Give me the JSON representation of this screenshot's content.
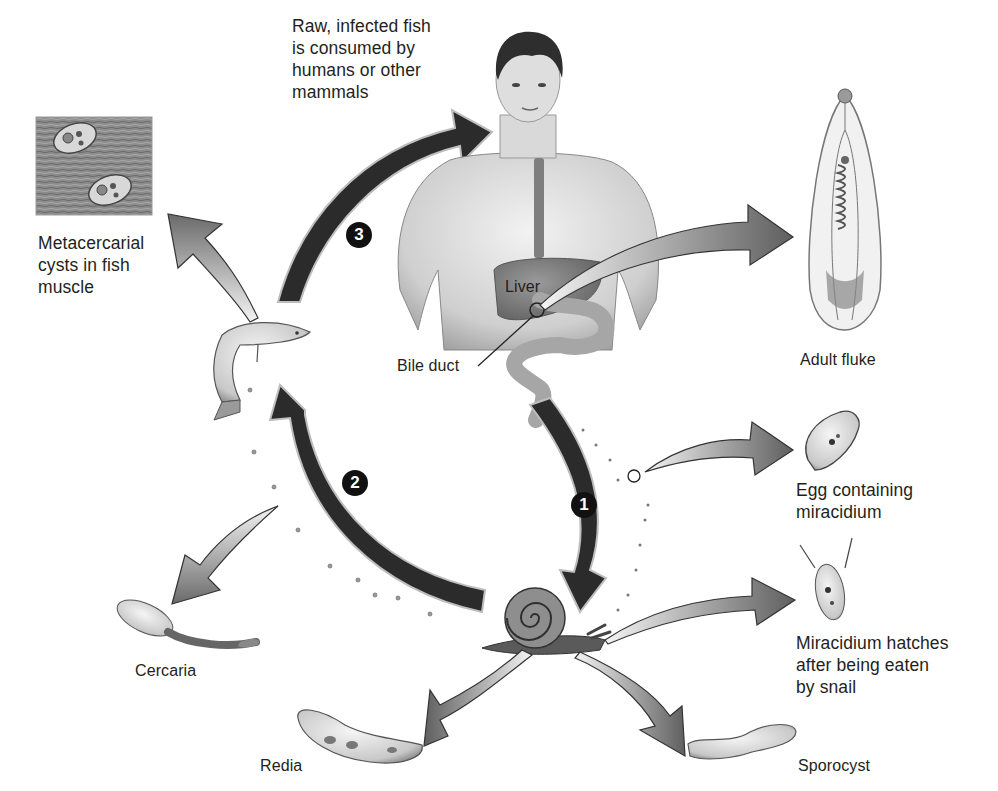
{
  "diagram": {
    "labels": {
      "raw_fish": "Raw, infected fish\nis consumed by\nhumans or other\nmammals",
      "metacercarial": "Metacercarial\ncysts in fish\nmuscle",
      "liver": "Liver",
      "bile_duct": "Bile duct",
      "adult_fluke": "Adult fluke",
      "egg": "Egg containing\nmiracidium",
      "miracidium": "Miracidium hatches\nafter being eaten\nby snail",
      "cercaria": "Cercaria",
      "redia": "Redia",
      "sporocyst": "Sporocyst"
    },
    "steps": [
      {
        "number": "1",
        "description": "Eggs passed from human to snail"
      },
      {
        "number": "2",
        "description": "Cercariae from snail infect fish"
      },
      {
        "number": "3",
        "description": "Fish consumed by humans"
      }
    ],
    "colors": {
      "main_arrow": "#2b2b2b",
      "branch_arrow_light": "#e6e6e6",
      "branch_arrow_dark": "#6e6e6e",
      "text": "#231f20",
      "badge": "#111111"
    }
  }
}
